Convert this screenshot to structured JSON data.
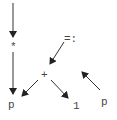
{
  "diagram": {
    "type": "expression-graph",
    "nodes": [
      {
        "id": "star",
        "label": "*",
        "x": 13,
        "y": 48
      },
      {
        "id": "assign",
        "label": "=:",
        "x": 71,
        "y": 40
      },
      {
        "id": "plus",
        "label": "+",
        "x": 45,
        "y": 76
      },
      {
        "id": "p_left",
        "label": "p",
        "x": 12,
        "y": 106
      },
      {
        "id": "one",
        "label": "1",
        "x": 76,
        "y": 107
      },
      {
        "id": "p_right",
        "label": "p",
        "x": 104,
        "y": 102
      }
    ],
    "edges": [
      {
        "from": "entry",
        "to": "star",
        "arrow": true
      },
      {
        "from": "star",
        "to": "p_left",
        "arrow": true
      },
      {
        "from": "assign",
        "to": "plus",
        "arrow": true
      },
      {
        "from": "p_right",
        "to": "assign",
        "arrow": true
      },
      {
        "from": "plus",
        "to": "p_left",
        "arrow": true
      },
      {
        "from": "plus",
        "to": "one",
        "arrow": true
      }
    ],
    "colors": {
      "line": "#333333",
      "text": "#444444",
      "background": "#ffffff"
    }
  }
}
